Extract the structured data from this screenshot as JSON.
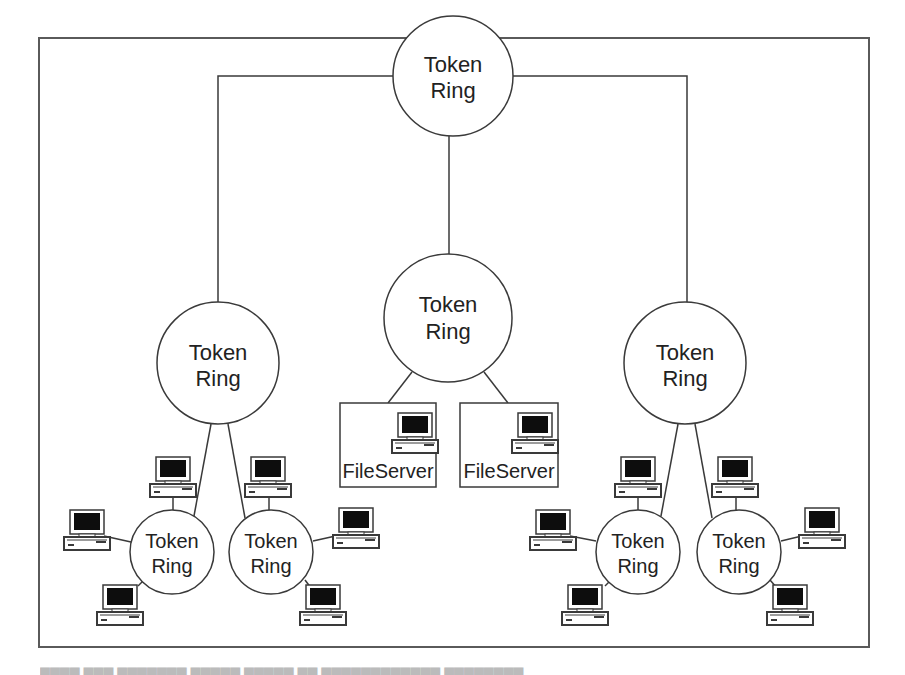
{
  "diagram": {
    "type": "hierarchical token ring network topology",
    "colors": {
      "stroke": "#3a3a3a",
      "text": "#222222",
      "screen": "#0d0d0d",
      "background": "#ffffff"
    },
    "frame": {
      "x": 39,
      "y": 38,
      "w": 830,
      "h": 609
    },
    "rings": [
      {
        "id": "top",
        "line1": "Token",
        "line2": "Ring",
        "cx": 453,
        "cy": 76,
        "r": 60,
        "font": 22
      },
      {
        "id": "middle",
        "line1": "Token",
        "line2": "Ring",
        "cx": 447,
        "cy": 318,
        "r": 64,
        "font": 22
      },
      {
        "id": "left",
        "line1": "Token",
        "line2": "Ring",
        "cx": 218,
        "cy": 363,
        "r": 61,
        "font": 22
      },
      {
        "id": "right",
        "line1": "Token",
        "line2": "Ring",
        "cx": 685,
        "cy": 363,
        "r": 61,
        "font": 22
      },
      {
        "id": "bottom-left-1",
        "line1": "Token",
        "line2": "Ring",
        "cx": 172,
        "cy": 552,
        "r": 42,
        "font": 20
      },
      {
        "id": "bottom-left-2",
        "line1": "Token",
        "line2": "Ring",
        "cx": 271,
        "cy": 552,
        "r": 42,
        "font": 20
      },
      {
        "id": "bottom-right-1",
        "line1": "Token",
        "line2": "Ring",
        "cx": 638,
        "cy": 552,
        "r": 42,
        "font": 20
      },
      {
        "id": "bottom-right-2",
        "line1": "Token",
        "line2": "Ring",
        "cx": 739,
        "cy": 552,
        "r": 42,
        "font": 20
      }
    ],
    "servers": [
      {
        "id": "fileserver-1",
        "label": "FileServer",
        "x": 340,
        "y": 403,
        "w": 96,
        "h": 84
      },
      {
        "id": "fileserver-2",
        "label": "FileServer",
        "x": 460,
        "y": 403,
        "w": 98,
        "h": 84
      }
    ],
    "workstation_count": 12,
    "caption_partial": "Figure (caption cut off at bottom edge)"
  }
}
